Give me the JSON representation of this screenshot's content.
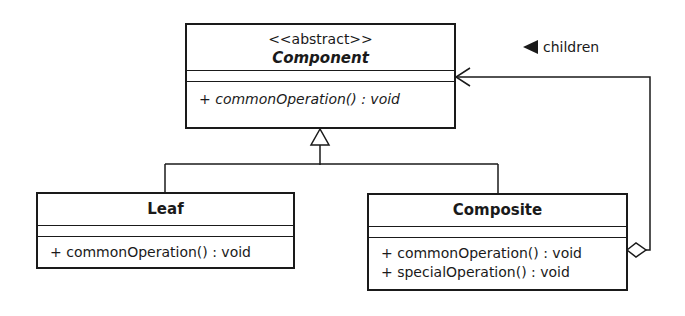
{
  "classes": {
    "component": {
      "stereotype": "<<abstract>>",
      "name": "Component",
      "operations": [
        "+ commonOperation() : void"
      ]
    },
    "leaf": {
      "name": "Leaf",
      "operations": [
        "+ commonOperation() : void"
      ]
    },
    "composite": {
      "name": "Composite",
      "operations": [
        "+ commonOperation() : void",
        "+ specialOperation() : void"
      ]
    }
  },
  "association": {
    "label": "children",
    "direction_icon": "left-triangle-icon"
  }
}
